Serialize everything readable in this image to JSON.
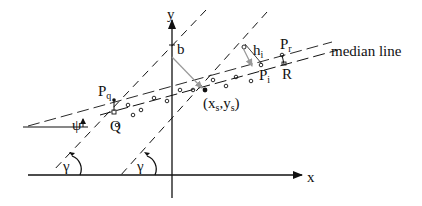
{
  "diagram": {
    "type": "geometric construction",
    "axes": {
      "x_label": "x",
      "y_label": "y"
    },
    "labels": {
      "b": "b",
      "median_line": "median line",
      "Pq_main": "P",
      "Pq_sub": "q",
      "Pr_main": "P",
      "Pr_sub": "r",
      "Pi_main": "P",
      "Pi_sub": "i",
      "hi_main": "h",
      "hi_sub": "i",
      "Q": "Q",
      "R": "R",
      "centroid_open": "(x",
      "centroid_xs_sub": "s",
      "centroid_comma": ",y",
      "centroid_ys_sub": "s",
      "centroid_close": ")",
      "psi": "ψ",
      "gamma_left": "γ",
      "gamma_right": "γ"
    },
    "elements": [
      "x-axis with arrow",
      "y-axis with arrow",
      "median line (dashed)",
      "lower parallel line (dashed)",
      "two steep dashed lines at angle gamma",
      "data points (small circles)",
      "perpendicular distance h_i from point P_i",
      "perpendicular from intercept b to centroid (x_s, y_s)",
      "angle psi between median line and horizontal",
      "angle gamma arcs"
    ],
    "colors": {
      "ink": "#111111",
      "gray": "#999999",
      "background": "#ffffff"
    }
  }
}
